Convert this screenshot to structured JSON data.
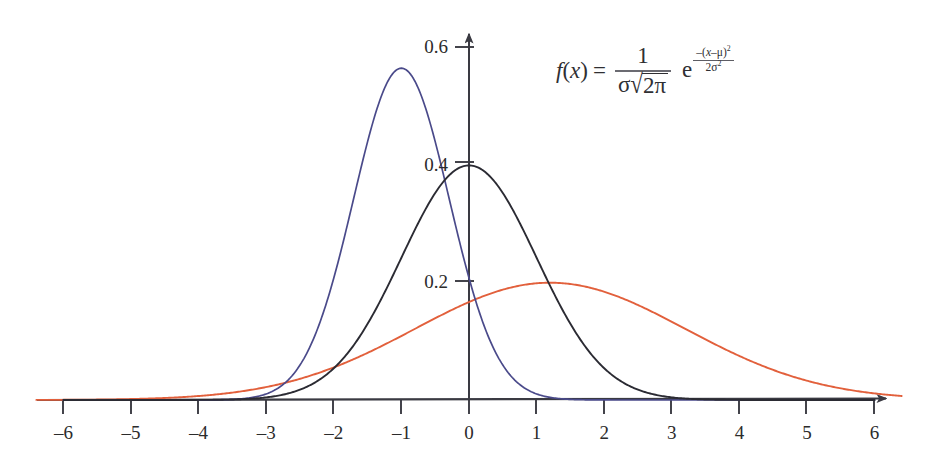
{
  "chart_data": {
    "type": "line",
    "title": "",
    "subtitle": "",
    "xlabel": "",
    "ylabel": "",
    "xlim": [
      -6.5,
      6.5
    ],
    "ylim": [
      0,
      0.63
    ],
    "grid": false,
    "legend": "none",
    "x_ticks": [
      "-6",
      "-5",
      "-4",
      "-3",
      "-2",
      "-1",
      "0",
      "1",
      "2",
      "3",
      "4",
      "5",
      "6"
    ],
    "x_tick_values": [
      -6,
      -5,
      -4,
      -3,
      -2,
      -1,
      0,
      1,
      2,
      3,
      4,
      5,
      6
    ],
    "y_ticks": [
      "0.2",
      "0.4",
      "0.6"
    ],
    "y_tick_values": [
      0.2,
      0.4,
      0.6
    ],
    "series": [
      {
        "name": "blue-normal-curve",
        "color": "#4a4a8a",
        "mu": -1.0,
        "sigma": 0.707,
        "peak_value": 0.564,
        "peak_x": -1.0,
        "x": [
          -6,
          -5.5,
          -5,
          -4.5,
          -4,
          -3.5,
          -3,
          -2.75,
          -2.5,
          -2.25,
          -2,
          -1.75,
          -1.5,
          -1.25,
          -1,
          -0.75,
          -0.5,
          -0.25,
          0,
          0.25,
          0.5,
          0.75,
          1,
          1.5,
          2,
          2.5,
          3,
          3.5,
          4,
          4.5,
          5,
          5.5,
          6
        ],
        "values": [
          0,
          0,
          0,
          0,
          0.0001,
          0.0011,
          0.0103,
          0.0255,
          0.0569,
          0.1133,
          0.2076,
          0.3332,
          0.4839,
          0.5593,
          0.5642,
          0.5593,
          0.4839,
          0.3332,
          0.2076,
          0.1133,
          0.0569,
          0.0255,
          0.0103,
          0.0011,
          0.0001,
          0,
          0,
          0,
          0,
          0,
          0,
          0,
          0
        ]
      },
      {
        "name": "black-normal-curve",
        "color": "#2b2b33",
        "mu": 0.0,
        "sigma": 1.0,
        "peak_value": 0.3989,
        "peak_x": 0.0,
        "x": [
          -6,
          -5.5,
          -5,
          -4.5,
          -4,
          -3.5,
          -3,
          -2.5,
          -2,
          -1.5,
          -1,
          -0.5,
          0,
          0.5,
          1,
          1.5,
          2,
          2.5,
          3,
          3.5,
          4,
          4.5,
          5,
          5.5,
          6
        ],
        "values": [
          0,
          0,
          1.5e-06,
          1.6e-05,
          0.0001338,
          0.0008727,
          0.0044318,
          0.0175283,
          0.053991,
          0.1295176,
          0.2419707,
          0.3520653,
          0.3989423,
          0.3520653,
          0.2419707,
          0.1295176,
          0.053991,
          0.0175283,
          0.0044318,
          0.0008727,
          0.0001338,
          1.6e-05,
          1.5e-06,
          0,
          0
        ]
      },
      {
        "name": "red-normal-curve",
        "color": "#e2603c",
        "mu": 1.2,
        "sigma": 2.0,
        "peak_value": 0.1995,
        "peak_x": 1.2,
        "x": [
          -6.4,
          -6,
          -5.5,
          -5,
          -4.5,
          -4,
          -3.5,
          -3,
          -2.5,
          -2,
          -1.5,
          -1,
          -0.5,
          0,
          0.5,
          1,
          1.2,
          1.5,
          2,
          2.5,
          3,
          3.5,
          4,
          4.5,
          5,
          5.5,
          6,
          6.4
        ],
        "values": [
          0.0043,
          0.0058,
          0.0082,
          0.0114,
          0.0155,
          0.0206,
          0.0269,
          0.0344,
          0.043,
          0.0526,
          0.063,
          0.0738,
          0.0846,
          0.0948,
          0.104,
          0.1116,
          0.1138,
          0.1173,
          0.1206,
          0.1213,
          0.1194,
          0.115,
          0.1084,
          0.1,
          0.0903,
          0.0799,
          0.0692,
          0.0609
        ]
      }
    ],
    "annotations": [
      {
        "name": "pdf-formula",
        "kind": "equation",
        "text": "f(x) = 1 / (sigma * sqrt(2*pi)) * e^(-(x-mu)^2 / (2*sigma^2))"
      }
    ]
  },
  "formula": {
    "fx_f": "f",
    "fx_open": "(",
    "fx_var": "x",
    "fx_close": ")",
    "equals": "=",
    "numerator": "1",
    "den_sigma": "σ",
    "radical": "√",
    "radicand": "2π",
    "exp_base": "e",
    "exp_num_prefix": "–(",
    "exp_num_var": "x",
    "exp_num_minus": "–",
    "exp_num_mu": "μ",
    "exp_num_close": ")",
    "exp_num_power": "2",
    "exp_den_two": "2",
    "exp_den_sigma": "σ",
    "exp_den_power": "2"
  },
  "axes": {
    "x_arrow": "arrow-right",
    "y_arrow": "arrow-up",
    "axis_color": "#3a3a42"
  }
}
